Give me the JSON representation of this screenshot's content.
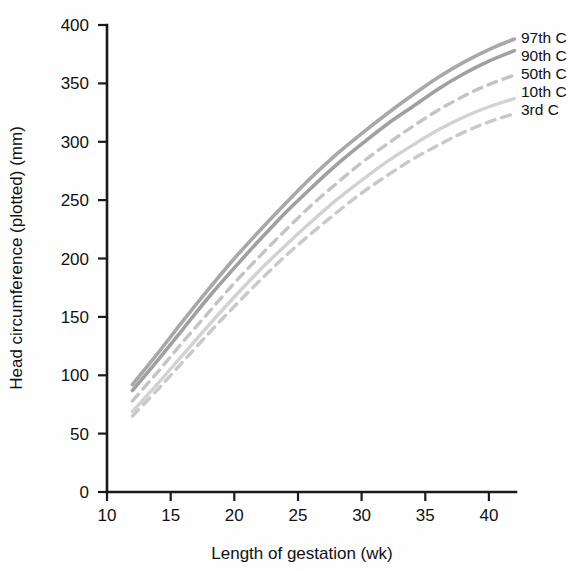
{
  "chart_data": {
    "type": "line",
    "title": "",
    "xlabel": "Length of gestation (wk)",
    "ylabel": "Head circumference (plotted) (mm)",
    "xlim": [
      10,
      42.5
    ],
    "ylim": [
      0,
      400
    ],
    "xticks": [
      10,
      15,
      20,
      25,
      30,
      35,
      40
    ],
    "xtick_labels": [
      "10",
      "15",
      "20",
      "25",
      "30",
      "35",
      "40"
    ],
    "yticks": [
      0,
      50,
      100,
      150,
      200,
      250,
      300,
      350,
      400
    ],
    "ytick_labels": [
      "0",
      "50",
      "100",
      "150",
      "200",
      "250",
      "300",
      "350",
      "400"
    ],
    "grid": false,
    "legend_position": "right-outside",
    "x": [
      12,
      14,
      16,
      18,
      20,
      22,
      24,
      26,
      28,
      30,
      32,
      34,
      36,
      38,
      40,
      42
    ],
    "series": [
      {
        "name": "97th C",
        "label": "97th C",
        "style": "solid",
        "color": "#a8a8a8",
        "width": 3.6,
        "values": [
          92,
          119,
          147,
          174,
          200,
          224,
          247,
          269,
          289,
          307,
          324,
          340,
          355,
          368,
          379,
          388
        ]
      },
      {
        "name": "90th C",
        "label": "90th C",
        "style": "solid",
        "color": "#a0a0a0",
        "width": 3.6,
        "values": [
          87,
          113,
          140,
          167,
          192,
          216,
          239,
          260,
          280,
          298,
          315,
          330,
          345,
          358,
          369,
          378
        ]
      },
      {
        "name": "50th C",
        "label": "50th C",
        "style": "dashed",
        "color": "#c4c4c4",
        "width": 3.4,
        "values": [
          78,
          103,
          129,
          154,
          179,
          202,
          224,
          245,
          264,
          282,
          298,
          313,
          327,
          339,
          349,
          357
        ]
      },
      {
        "name": "10th C",
        "label": "10th C",
        "style": "solid",
        "color": "#d2d2d2",
        "width": 3.4,
        "values": [
          69,
          93,
          118,
          143,
          167,
          190,
          211,
          231,
          250,
          267,
          283,
          297,
          310,
          321,
          330,
          337
        ]
      },
      {
        "name": "3rd C",
        "label": "3rd C",
        "style": "dashed",
        "color": "#c9c9c9",
        "width": 3.4,
        "values": [
          65,
          88,
          112,
          136,
          159,
          181,
          202,
          221,
          239,
          256,
          271,
          285,
          297,
          308,
          317,
          324
        ]
      }
    ],
    "legend_entries": [
      {
        "label": "97th C",
        "y_px": 38
      },
      {
        "label": "90th C",
        "y_px": 56
      },
      {
        "label": "50th C",
        "y_px": 74
      },
      {
        "label": "10th C",
        "y_px": 92
      },
      {
        "label": "3rd C",
        "y_px": 110
      }
    ],
    "colors": {
      "axis": "#1a1a1a",
      "text": "#111111",
      "background": "#fefefe",
      "curve_dark": "#a4a4a4",
      "curve_light": "#cfcfcf"
    }
  }
}
